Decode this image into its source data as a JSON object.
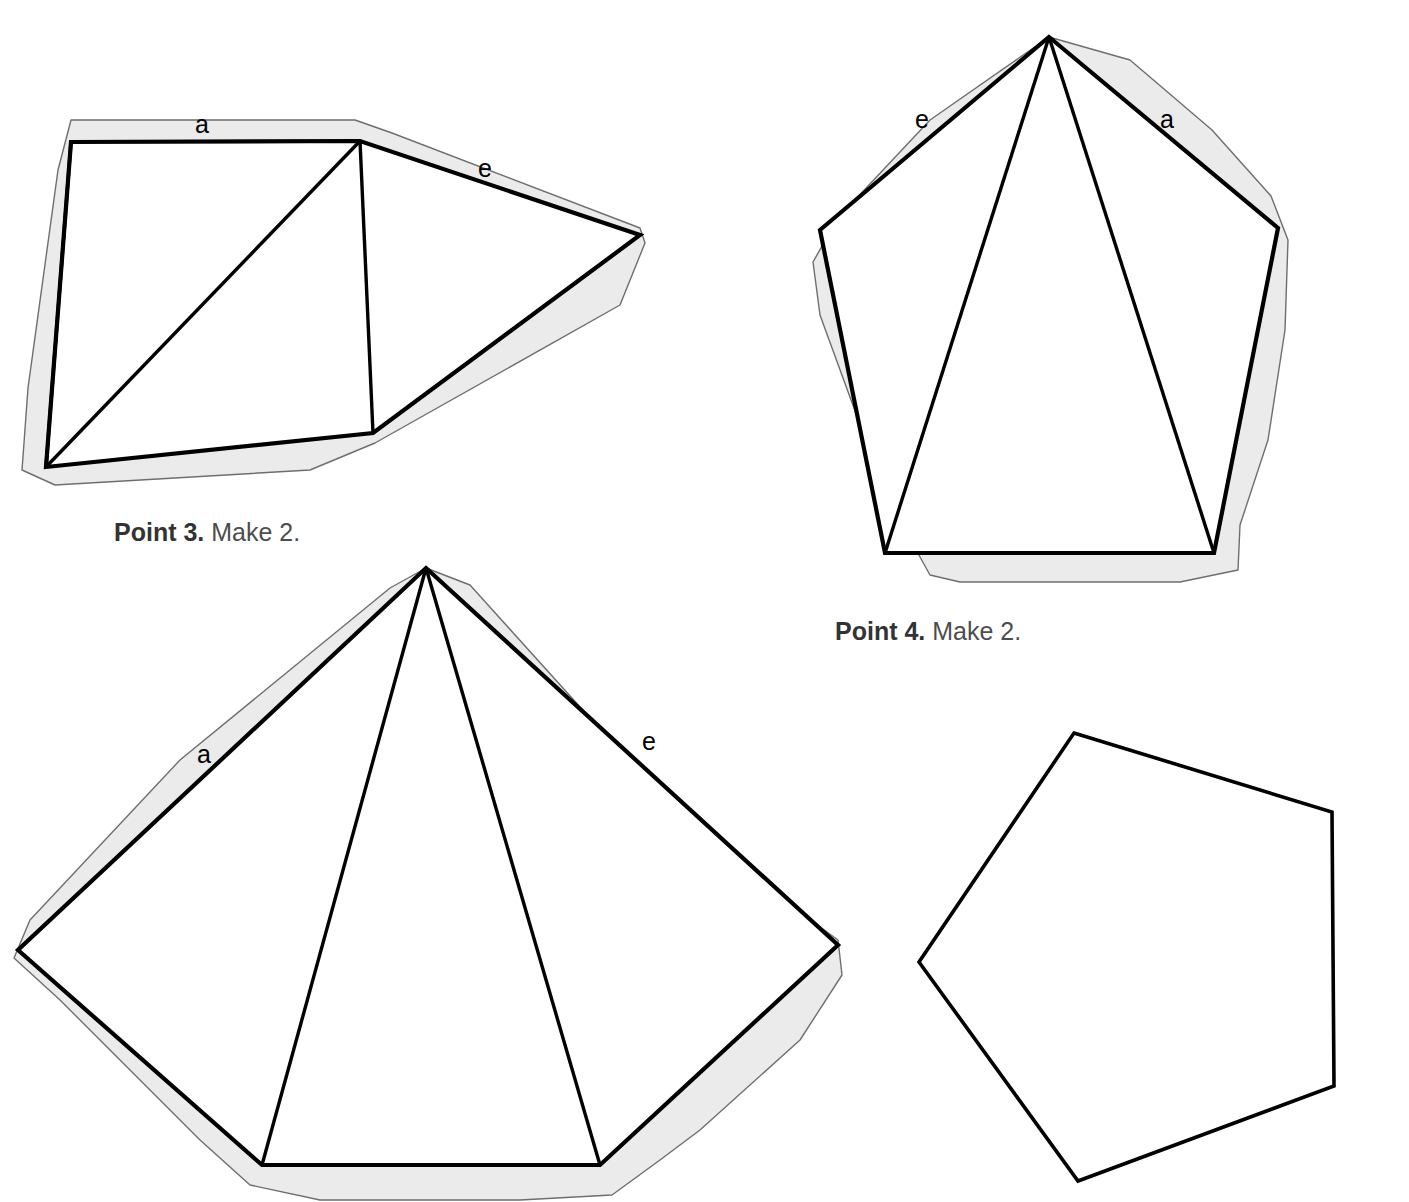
{
  "page": {
    "background_color": "#ffffff",
    "width": 1409,
    "height": 1202,
    "ink_color": "#000000",
    "seam_fill_color": "#ebebeb",
    "seam_line_color": "#6e6e6e",
    "caption_color": "#4d4d4d"
  },
  "figures": [
    {
      "id": "point-3-pattern",
      "caption_strong": "Point 3.",
      "caption_rest": " Make 2.",
      "labels": {
        "a": "a",
        "e": "e"
      }
    },
    {
      "id": "point-4-pattern",
      "caption_strong": "Point 4.",
      "caption_rest": " Make 2.",
      "labels": {
        "a": "a",
        "e": "e"
      }
    },
    {
      "id": "point-5-pattern",
      "caption_strong": "",
      "caption_rest": "",
      "labels": {
        "a": "a",
        "e": "e"
      }
    },
    {
      "id": "pentagon-base-pattern",
      "caption_strong": "",
      "caption_rest": "",
      "labels": {}
    }
  ],
  "captions": {
    "point3_strong": "Point 3.",
    "point3_rest": " Make 2.",
    "point4_strong": "Point 4.",
    "point4_rest": " Make 2."
  },
  "edge_labels": {
    "fig1_a": "a",
    "fig1_e": "e",
    "fig2_a": "a",
    "fig2_e": "e",
    "fig3_a": "a",
    "fig3_e": "e"
  },
  "geometry": {
    "fig1_point3": {
      "seam_outline": "71,120 355,120 392,133 640,228 645,243 620,305 375,443 310,470 55,485 22,470 28,388 58,170",
      "cut_shape": "71,142 360,141 640,235 373,433 46,467",
      "fold_lines": [
        "360,141 46,467",
        "360,141 373,433",
        "71,142 46,467"
      ]
    },
    "fig2_point4": {
      "seam_outline": "1049,37 1130,60 1212,130 1271,196 1288,240 1285,330 1268,440 1240,525 1238,570 1180,582 960,582 930,575 905,530 862,430 820,315 813,262 838,218 930,120",
      "cut_shape": "1049,37 1278,228 1214,553 885,553 820,230",
      "fold_lines": [
        "1049,37 885,553",
        "1049,37 1214,553"
      ]
    },
    "fig3_point5": {
      "seam_outline": "426,568 470,585 700,840 838,940 842,975 800,1040 700,1130 660,1160 612,1195 520,1200 320,1200 250,1185 200,1140 120,1060 60,1000 14,958 30,920 180,760 390,588",
      "cut_shape": "426,568 838,945 600,1165 262,1165 18,950",
      "fold_lines": [
        "426,568 262,1165",
        "426,568 600,1165"
      ]
    },
    "fig4_pentagon": {
      "cut_shape": "1074,733 1332,812 1334,1086 1078,1181 919,962"
    }
  },
  "label_positions": {
    "fig1_a": {
      "left": 195,
      "top": 112
    },
    "fig1_e": {
      "left": 478,
      "top": 156
    },
    "fig2_a": {
      "left": 1160,
      "top": 107
    },
    "fig2_e": {
      "left": 915,
      "top": 107
    },
    "fig3_a": {
      "left": 197,
      "top": 742
    },
    "fig3_e": {
      "left": 642,
      "top": 729
    },
    "caption_point3": {
      "left": 114,
      "top": 520
    },
    "caption_point4": {
      "left": 835,
      "top": 619
    }
  }
}
